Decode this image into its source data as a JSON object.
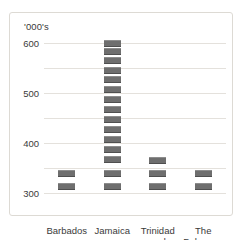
{
  "chart_data": {
    "type": "bar",
    "title": "",
    "subtitle": "",
    "xlabel": "",
    "ylabel": "'000's",
    "unit_label": "'000's",
    "categories": [
      "Barbados",
      "Jamaica",
      "Trinidad and Tobago",
      "The Bahamas"
    ],
    "category_labels_multiline": [
      "Barbados",
      "Jamaica",
      "Trinidad\nand Tobago",
      "The\nBahamas"
    ],
    "values": [
      80,
      600,
      130,
      80
    ],
    "ylim": [
      0,
      600
    ],
    "yticks": [
      0,
      100,
      200,
      300,
      400,
      500,
      600
    ],
    "ytick_labels": [
      "0",
      "100",
      "200",
      "300",
      "400",
      "500",
      "600"
    ],
    "grid": true,
    "legend": false,
    "legend_position": "none",
    "bar_style": "segmented-dashed",
    "bar_color": "#6e6e6e",
    "grid_color": "#e4e1dc",
    "segments": {
      "Barbados": [
        25,
        80
      ],
      "Jamaica": [
        25,
        80,
        135,
        175,
        215,
        255,
        295,
        335,
        375,
        415,
        455,
        490,
        530,
        565,
        600
      ],
      "Trinidad and Tobago": [
        25,
        80,
        130
      ],
      "The Bahamas": [
        25,
        80
      ]
    }
  }
}
